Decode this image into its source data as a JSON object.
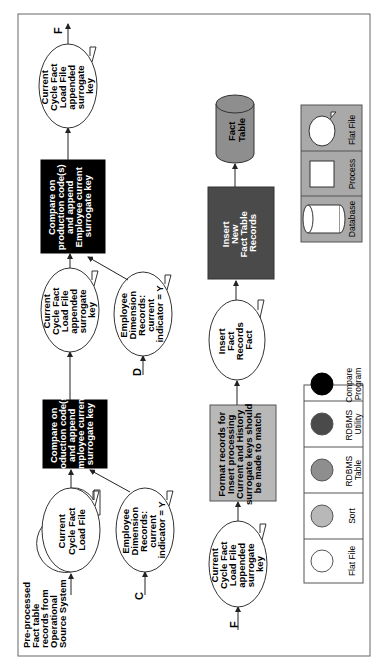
{
  "diagram": {
    "orientation": "rotated-90-ccw",
    "colors": {
      "frame": "#555555",
      "compare_program": "#000000",
      "rdbms_utility": "#4a4a4a",
      "rdbms_table": "#8e8e8e",
      "sort": "#b8b8b8",
      "flat_file": "#ffffff",
      "legend_bg": "#a9a9a9"
    },
    "row1": {
      "source_label": [
        "Pre-processed",
        "Fact table",
        "records from",
        "Operational",
        "Source System"
      ],
      "file1": [
        "Current",
        "Cycle Fact",
        "Load File"
      ],
      "connector_c": "C",
      "emp_dim1": [
        "Employee",
        "Dimension",
        "Records:",
        "current",
        "indicator = Y"
      ],
      "compare1": [
        "Compare on",
        "production code(s)",
        "and append",
        "Employee current",
        "surrogate key"
      ],
      "file2": [
        "Current",
        "Cycle Fact",
        "Load File",
        "appended",
        "surrogate",
        "key"
      ],
      "connector_d": "D",
      "emp_dim2": [
        "Employee",
        "Dimension",
        "Records:",
        "current",
        "indicator = Y"
      ],
      "compare2": [
        "Compare on",
        "production code(s)",
        "and append",
        "Employee current",
        "surrogate key"
      ],
      "file3": [
        "Current",
        "Cycle Fact",
        "Load File",
        "appended",
        "surrogate",
        "key"
      ],
      "connector_f_out": "F"
    },
    "row2": {
      "connector_f_in": "F",
      "file4": [
        "Current",
        "Cycle Fact",
        "Load File",
        "appended",
        "surrogate",
        "key"
      ],
      "format_process": [
        "Format records for",
        "Insert processing",
        "Current and History",
        "surrogate keys should",
        "be made to match"
      ],
      "insert_file": [
        "Insert",
        "Fact",
        "Records",
        "Fact"
      ],
      "insert_process": [
        "Insert",
        "New",
        "Fact Table",
        "Records"
      ],
      "fact_table": [
        "Fact",
        "Table"
      ]
    },
    "legend_colors": {
      "items": [
        {
          "label": [
            "Flat File"
          ],
          "color": "#ffffff"
        },
        {
          "label": [
            "Sort"
          ],
          "color": "#b8b8b8"
        },
        {
          "label": [
            "RDBMS",
            "Table"
          ],
          "color": "#8e8e8e"
        },
        {
          "label": [
            "RDBMS",
            "Utility"
          ],
          "color": "#4a4a4a"
        },
        {
          "label": [
            "Compare",
            "Program"
          ],
          "color": "#000000"
        }
      ]
    },
    "legend_shapes": {
      "items": [
        {
          "label": "Database",
          "shape": "cylinder"
        },
        {
          "label": "Process",
          "shape": "rectangle"
        },
        {
          "label": "Flat File",
          "shape": "flat-file"
        }
      ]
    }
  }
}
